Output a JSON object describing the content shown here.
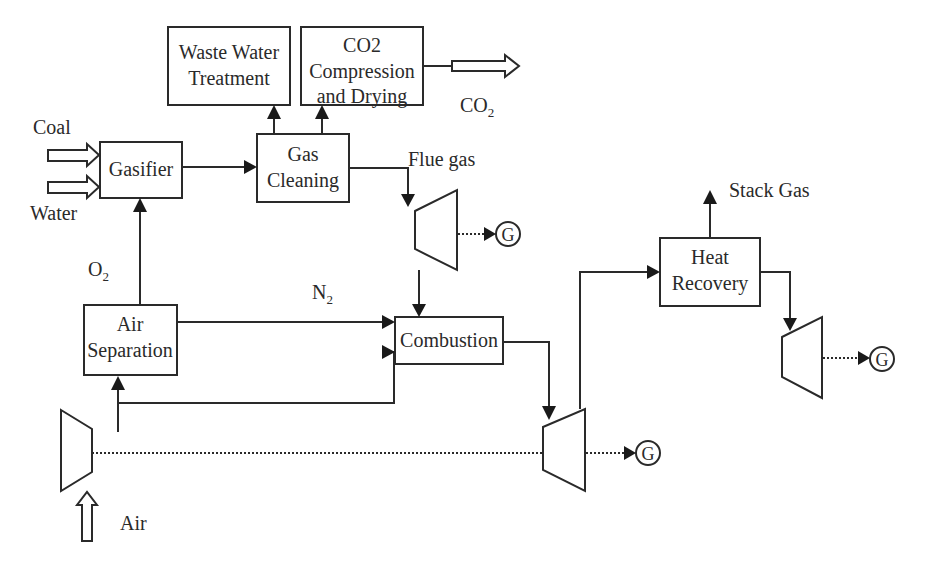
{
  "diagram": {
    "blocks": {
      "waste_water": {
        "line1": "Waste Water",
        "line2": "Treatment"
      },
      "co2_compression": {
        "line1": "CO2",
        "line2": "Compression",
        "line3": "and Drying"
      },
      "gasifier": {
        "label": "Gasifier"
      },
      "gas_cleaning": {
        "line1": "Gas",
        "line2": "Cleaning"
      },
      "air_separation": {
        "line1": "Air",
        "line2": "Separation"
      },
      "combustion": {
        "label": "Combustion"
      },
      "heat_recovery": {
        "line1": "Heat",
        "line2": "Recovery"
      }
    },
    "streams": {
      "coal": "Coal",
      "water": "Water",
      "co2_main": "CO",
      "co2_sub": "2",
      "flue_gas": "Flue gas",
      "o2_main": "O",
      "o2_sub": "2",
      "n2_main": "N",
      "n2_sub": "2",
      "stack_gas": "Stack Gas",
      "air": "Air"
    },
    "generators": {
      "g1": "G",
      "g2": "G",
      "g3": "G"
    }
  }
}
